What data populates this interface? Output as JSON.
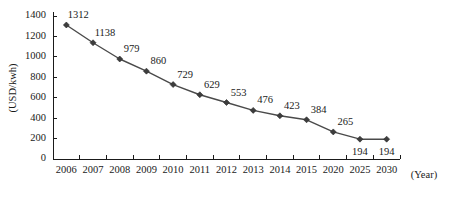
{
  "chart_data": {
    "type": "line",
    "title": "",
    "xlabel": "(Year)",
    "ylabel": "(USD/kwh)",
    "categories": [
      "2006",
      "2007",
      "2008",
      "2009",
      "2010",
      "2011",
      "2012",
      "2013",
      "2014",
      "2015",
      "2020",
      "2025",
      "2030"
    ],
    "values": [
      1312,
      1138,
      979,
      860,
      729,
      629,
      553,
      476,
      423,
      384,
      265,
      194,
      194
    ],
    "point_labels": [
      "1312",
      "1138",
      "979",
      "860",
      "729",
      "629",
      "553",
      "476",
      "423",
      "384",
      "265",
      "194",
      "194"
    ],
    "label_positions": [
      "above",
      "above",
      "above",
      "above",
      "above",
      "above",
      "above",
      "above",
      "above",
      "above",
      "above",
      "below",
      "below"
    ],
    "ylim": [
      0,
      1400
    ],
    "y_ticks": [
      0,
      200,
      400,
      600,
      800,
      1000,
      1200,
      1400
    ],
    "y_tick_labels": [
      "0",
      "200",
      "400",
      "600",
      "800",
      "1000",
      "1200",
      "1400"
    ],
    "grid": false,
    "legend": false,
    "series_color": "#4a4a4a",
    "marker": "diamond",
    "marker_color": "#3d3d3d",
    "axis_color": "#1a1a1a",
    "background": "#ffffff"
  }
}
